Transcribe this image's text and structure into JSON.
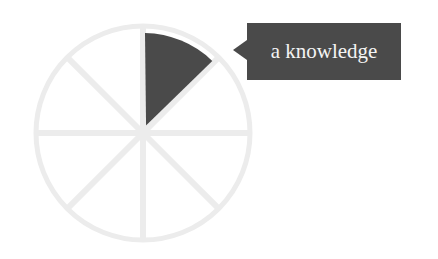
{
  "chart_data": {
    "type": "pie",
    "title": "",
    "slices": 8,
    "categories": [
      "a knowledge",
      "",
      "",
      "",
      "",
      "",
      "",
      ""
    ],
    "values": [
      1,
      1,
      1,
      1,
      1,
      1,
      1,
      1
    ],
    "highlighted_index": 0,
    "highlighted_label": "a knowledge",
    "colors": {
      "highlight": "#4a4a4a",
      "inactive": "#f1f1f1",
      "separator": "#e2e2e2"
    },
    "legend": "none",
    "grid": false
  },
  "tooltip": {
    "text": "a knowledge"
  }
}
